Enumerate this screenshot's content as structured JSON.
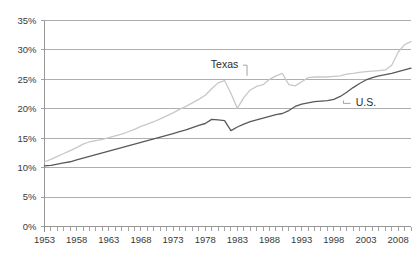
{
  "chart_data": {
    "type": "line",
    "title": "",
    "subtitle": "",
    "xlabel": "",
    "ylabel": "",
    "xlim": [
      1953,
      2010
    ],
    "ylim": [
      0,
      0.35
    ],
    "grid": true,
    "legend_position": "inline-annotation",
    "y_tick_labels": [
      "0%",
      "5%",
      "10%",
      "15%",
      "20%",
      "25%",
      "30%",
      "35%"
    ],
    "y_tick_values": [
      0,
      5,
      10,
      15,
      20,
      25,
      30,
      35
    ],
    "x_tick_labels": [
      "1953",
      "1958",
      "1963",
      "1968",
      "1973",
      "1978",
      "1983",
      "1988",
      "1993",
      "1998",
      "2003",
      "2008"
    ],
    "x_tick_values": [
      1953,
      1958,
      1963,
      1968,
      1973,
      1978,
      1983,
      1988,
      1993,
      1998,
      2003,
      2008
    ],
    "x_minor_tick_step": 1,
    "annotations": [
      {
        "text": "Texas",
        "x": 1981,
        "y": 27.5
      },
      {
        "text": "U.S.",
        "x": 2003,
        "y": 21.0
      }
    ],
    "series": [
      {
        "name": "Texas",
        "color": "#c8c8c8",
        "x": [
          1953,
          1954,
          1955,
          1956,
          1957,
          1958,
          1959,
          1960,
          1961,
          1962,
          1963,
          1964,
          1965,
          1966,
          1967,
          1968,
          1969,
          1970,
          1971,
          1972,
          1973,
          1974,
          1975,
          1976,
          1977,
          1978,
          1979,
          1980,
          1981,
          1982,
          1983,
          1984,
          1985,
          1986,
          1987,
          1988,
          1989,
          1990,
          1991,
          1992,
          1993,
          1994,
          1995,
          1996,
          1997,
          1998,
          1999,
          2000,
          2001,
          2002,
          2003,
          2004,
          2005,
          2006,
          2007,
          2008,
          2009,
          2010
        ],
        "values": [
          11.0,
          11.4,
          11.9,
          12.4,
          12.9,
          13.4,
          14.0,
          14.4,
          14.6,
          14.8,
          15.1,
          15.4,
          15.7,
          16.1,
          16.5,
          17.0,
          17.4,
          17.8,
          18.3,
          18.8,
          19.3,
          19.9,
          20.4,
          21.0,
          21.6,
          22.3,
          23.4,
          24.4,
          24.8,
          22.6,
          20.1,
          21.9,
          23.2,
          23.8,
          24.1,
          25.0,
          25.6,
          26.0,
          24.1,
          23.9,
          24.6,
          25.3,
          25.4,
          25.4,
          25.4,
          25.5,
          25.6,
          25.9,
          26.0,
          26.2,
          26.3,
          26.4,
          26.5,
          26.6,
          27.4,
          29.6,
          30.9,
          31.4
        ],
        "endpoint_value": 31.4
      },
      {
        "name": "U.S.",
        "color": "#595959",
        "x": [
          1953,
          1954,
          1955,
          1956,
          1957,
          1958,
          1959,
          1960,
          1961,
          1962,
          1963,
          1964,
          1965,
          1966,
          1967,
          1968,
          1969,
          1970,
          1971,
          1972,
          1973,
          1974,
          1975,
          1976,
          1977,
          1978,
          1979,
          1980,
          1981,
          1982,
          1983,
          1984,
          1985,
          1986,
          1987,
          1988,
          1989,
          1990,
          1991,
          1992,
          1993,
          1994,
          1995,
          1996,
          1997,
          1998,
          1999,
          2000,
          2001,
          2002,
          2003,
          2004,
          2005,
          2006,
          2007,
          2008,
          2009,
          2010
        ],
        "values": [
          10.3,
          10.4,
          10.6,
          10.8,
          11.0,
          11.3,
          11.6,
          11.9,
          12.2,
          12.5,
          12.8,
          13.1,
          13.4,
          13.7,
          14.0,
          14.3,
          14.6,
          14.9,
          15.2,
          15.5,
          15.8,
          16.1,
          16.4,
          16.8,
          17.2,
          17.5,
          18.2,
          18.1,
          18.0,
          16.3,
          16.9,
          17.4,
          17.8,
          18.1,
          18.4,
          18.7,
          19.0,
          19.2,
          19.7,
          20.4,
          20.8,
          21.0,
          21.2,
          21.3,
          21.4,
          21.6,
          22.1,
          22.8,
          23.6,
          24.3,
          24.9,
          25.3,
          25.6,
          25.8,
          26.0,
          26.3,
          26.6,
          26.9
        ],
        "endpoint_value": 26.9
      }
    ]
  }
}
